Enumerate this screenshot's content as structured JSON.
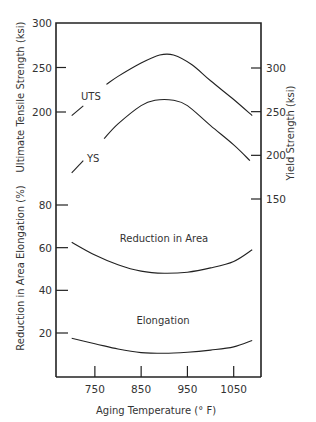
{
  "chart_data": {
    "type": "line",
    "title": "",
    "xlabel": "Aging Temperature (° F)",
    "xlim": [
      666,
      1109
    ],
    "x_ticks": [
      750,
      850,
      950,
      1050
    ],
    "grid": false,
    "legend": "none",
    "axes": {
      "left_upper": {
        "label": "Ultimate Tensile Strength (ksi)",
        "ticks": [
          300,
          250,
          200
        ],
        "ylim": [
          200,
          300
        ]
      },
      "right_upper": {
        "label": "Yield Strength (ksi)",
        "ticks": [
          300,
          250,
          200,
          150
        ],
        "ylim": [
          150,
          350
        ]
      },
      "left_lower": {
        "label": "Reduction in Area Elongation (%)",
        "ticks": [
          80,
          60,
          40,
          20
        ],
        "ylim": [
          0,
          80
        ]
      }
    },
    "series": [
      {
        "name": "UTS",
        "label": "UTS",
        "axis": "left_upper",
        "gap_after_index": 1,
        "x": [
          700,
          725,
          775,
          800,
          850,
          890,
          920,
          960,
          1000,
          1050,
          1090
        ],
        "values": [
          196,
          207,
          231,
          240,
          255,
          264,
          264,
          253,
          235,
          214,
          196
        ]
      },
      {
        "name": "YS",
        "label": "YS",
        "axis": "right_upper",
        "gap_after_index": 1,
        "x": [
          700,
          725,
          770,
          800,
          850,
          880,
          920,
          950,
          1000,
          1050,
          1085
        ],
        "values": [
          180,
          194,
          219,
          236,
          257,
          263,
          263,
          257,
          234,
          212,
          194
        ]
      },
      {
        "name": "Reduction in Area",
        "label": "Reduction in Area",
        "axis": "left_lower",
        "x": [
          700,
          750,
          800,
          850,
          900,
          950,
          1000,
          1050,
          1090
        ],
        "values": [
          62.5,
          56.5,
          52,
          49,
          48,
          48.5,
          50.5,
          53.5,
          59
        ]
      },
      {
        "name": "Elongation",
        "label": "Elongation",
        "axis": "left_lower",
        "x": [
          700,
          750,
          800,
          850,
          900,
          950,
          1000,
          1050,
          1090
        ],
        "values": [
          17.5,
          15,
          12.5,
          10.8,
          10.5,
          11,
          12,
          13.5,
          16.5
        ]
      }
    ]
  }
}
